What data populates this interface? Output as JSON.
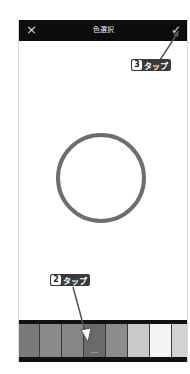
{
  "header": {
    "title": "色選択",
    "close_icon": "×",
    "confirm_icon": "✓"
  },
  "canvas": {
    "selected_color_preview": "circle outline",
    "circle_color": "#6e6e6e"
  },
  "swatches": {
    "colors": [
      "#7a7a7a",
      "#8a8a8a",
      "#868686",
      "#6a6a6a",
      "#8c8c8c",
      "#c9c9c9",
      "#f4f4f4",
      "#d2d2d2",
      "#b0b0b0"
    ],
    "more_label": "..."
  },
  "annotations": [
    {
      "number": "3",
      "text": "タップ"
    },
    {
      "number": "2",
      "text": "タップ"
    }
  ]
}
